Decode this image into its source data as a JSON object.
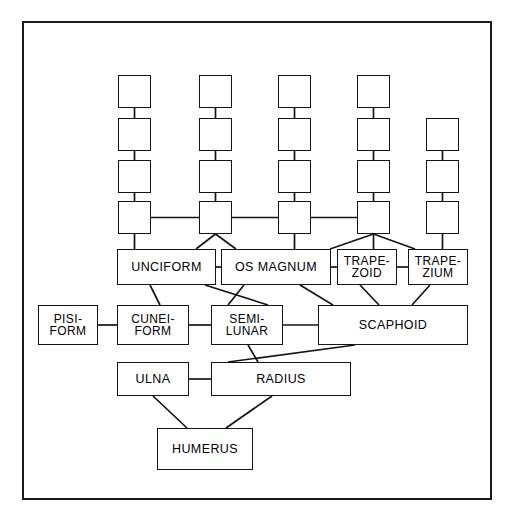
{
  "diagram": {
    "type": "node-link-diagram",
    "background_color": "#ffffff",
    "line_color": "#151515",
    "border_color": "#1a1a1a",
    "frame": {
      "x": 22,
      "y": 21,
      "width": 470,
      "height": 479
    },
    "caption": "",
    "columns": [
      {
        "name": "column-1",
        "x": 118,
        "box_count": 4,
        "top_y": 75
      },
      {
        "name": "column-2",
        "x": 199,
        "box_count": 4,
        "top_y": 75
      },
      {
        "name": "column-3",
        "x": 278,
        "box_count": 4,
        "top_y": 75
      },
      {
        "name": "column-4",
        "x": 357,
        "box_count": 4,
        "top_y": 75
      },
      {
        "name": "column-5",
        "x": 426,
        "box_count": 3,
        "top_y": 118
      }
    ],
    "blank_nodes": [
      {
        "id": "c1r1",
        "label": "",
        "x": 118,
        "y": 75,
        "w": 33,
        "h": 33
      },
      {
        "id": "c1r2",
        "label": "",
        "x": 118,
        "y": 118,
        "w": 33,
        "h": 33
      },
      {
        "id": "c1r3",
        "label": "",
        "x": 118,
        "y": 160,
        "w": 33,
        "h": 33
      },
      {
        "id": "c1r4",
        "label": "",
        "x": 118,
        "y": 201,
        "w": 33,
        "h": 33
      },
      {
        "id": "c2r1",
        "label": "",
        "x": 199,
        "y": 75,
        "w": 33,
        "h": 33
      },
      {
        "id": "c2r2",
        "label": "",
        "x": 199,
        "y": 118,
        "w": 33,
        "h": 33
      },
      {
        "id": "c2r3",
        "label": "",
        "x": 199,
        "y": 160,
        "w": 33,
        "h": 33
      },
      {
        "id": "c2r4",
        "label": "",
        "x": 199,
        "y": 201,
        "w": 33,
        "h": 33
      },
      {
        "id": "c3r1",
        "label": "",
        "x": 278,
        "y": 75,
        "w": 33,
        "h": 33
      },
      {
        "id": "c3r2",
        "label": "",
        "x": 278,
        "y": 118,
        "w": 33,
        "h": 33
      },
      {
        "id": "c3r3",
        "label": "",
        "x": 278,
        "y": 160,
        "w": 33,
        "h": 33
      },
      {
        "id": "c3r4",
        "label": "",
        "x": 278,
        "y": 201,
        "w": 33,
        "h": 33
      },
      {
        "id": "c4r1",
        "label": "",
        "x": 357,
        "y": 75,
        "w": 33,
        "h": 33
      },
      {
        "id": "c4r2",
        "label": "",
        "x": 357,
        "y": 118,
        "w": 33,
        "h": 33
      },
      {
        "id": "c4r3",
        "label": "",
        "x": 357,
        "y": 160,
        "w": 33,
        "h": 33
      },
      {
        "id": "c4r4",
        "label": "",
        "x": 357,
        "y": 201,
        "w": 33,
        "h": 33
      },
      {
        "id": "c5r1",
        "label": "",
        "x": 426,
        "y": 118,
        "w": 33,
        "h": 33
      },
      {
        "id": "c5r2",
        "label": "",
        "x": 426,
        "y": 160,
        "w": 33,
        "h": 33
      },
      {
        "id": "c5r3",
        "label": "",
        "x": 426,
        "y": 201,
        "w": 33,
        "h": 33
      }
    ],
    "labeled_nodes": [
      {
        "id": "uniciform",
        "label": "UNCIFORM",
        "x": 117,
        "y": 249,
        "w": 99,
        "h": 36
      },
      {
        "id": "os-magnum",
        "label": "OS MAGNUM",
        "x": 221,
        "y": 249,
        "w": 110,
        "h": 36
      },
      {
        "id": "trapezoid",
        "label": "TRAPE-\nZOID",
        "x": 337,
        "y": 249,
        "w": 60,
        "h": 36
      },
      {
        "id": "trapezium",
        "label": "TRAPE-\nZIUM",
        "x": 408,
        "y": 249,
        "w": 60,
        "h": 36
      },
      {
        "id": "pisiform",
        "label": "PISI-\nFORM",
        "x": 38,
        "y": 305,
        "w": 60,
        "h": 40
      },
      {
        "id": "cuneiform",
        "label": "CUNEI-\nFORM",
        "x": 117,
        "y": 305,
        "w": 72,
        "h": 40
      },
      {
        "id": "semilunar",
        "label": "SEMI-\nLUNAR",
        "x": 211,
        "y": 305,
        "w": 72,
        "h": 40
      },
      {
        "id": "scaphoid",
        "label": "SCAPHOID",
        "x": 318,
        "y": 305,
        "w": 150,
        "h": 40
      },
      {
        "id": "ulna",
        "label": "ULNA",
        "x": 117,
        "y": 362,
        "w": 72,
        "h": 34
      },
      {
        "id": "radius",
        "label": "RADIUS",
        "x": 211,
        "y": 362,
        "w": 140,
        "h": 34
      },
      {
        "id": "humerus",
        "label": "HUMERUS",
        "x": 157,
        "y": 428,
        "w": 96,
        "h": 42
      }
    ],
    "connections": [
      {
        "from": "c1r1",
        "to": "c1r2",
        "kind": "vertical"
      },
      {
        "from": "c1r2",
        "to": "c1r3",
        "kind": "vertical"
      },
      {
        "from": "c1r3",
        "to": "c1r4",
        "kind": "vertical"
      },
      {
        "from": "c2r1",
        "to": "c2r2",
        "kind": "vertical"
      },
      {
        "from": "c2r2",
        "to": "c2r3",
        "kind": "vertical"
      },
      {
        "from": "c2r3",
        "to": "c2r4",
        "kind": "vertical"
      },
      {
        "from": "c3r1",
        "to": "c3r2",
        "kind": "vertical"
      },
      {
        "from": "c3r2",
        "to": "c3r3",
        "kind": "vertical"
      },
      {
        "from": "c3r3",
        "to": "c3r4",
        "kind": "vertical"
      },
      {
        "from": "c4r1",
        "to": "c4r2",
        "kind": "vertical"
      },
      {
        "from": "c4r2",
        "to": "c4r3",
        "kind": "vertical"
      },
      {
        "from": "c4r3",
        "to": "c4r4",
        "kind": "vertical"
      },
      {
        "from": "c5r1",
        "to": "c5r2",
        "kind": "vertical"
      },
      {
        "from": "c5r2",
        "to": "c5r3",
        "kind": "vertical"
      },
      {
        "from": "c1r4",
        "to": "c2r4",
        "kind": "horizontal"
      },
      {
        "from": "c2r4",
        "to": "c3r4",
        "kind": "horizontal"
      },
      {
        "from": "c3r4",
        "to": "c4r4",
        "kind": "horizontal"
      },
      {
        "from": "c1r4",
        "to": "uniciform",
        "kind": "vertical"
      },
      {
        "from": "c2r4",
        "to": "uniciform",
        "kind": "diagonal"
      },
      {
        "from": "c2r4",
        "to": "os-magnum",
        "kind": "diagonal"
      },
      {
        "from": "c3r4",
        "to": "os-magnum",
        "kind": "vertical"
      },
      {
        "from": "c4r4",
        "to": "os-magnum",
        "kind": "diagonal"
      },
      {
        "from": "c4r4",
        "to": "trapezoid",
        "kind": "vertical"
      },
      {
        "from": "c4r4",
        "to": "trapezium",
        "kind": "diagonal"
      },
      {
        "from": "c5r3",
        "to": "trapezium",
        "kind": "vertical"
      },
      {
        "from": "uniciform",
        "to": "os-magnum",
        "kind": "horizontal"
      },
      {
        "from": "os-magnum",
        "to": "trapezoid",
        "kind": "horizontal"
      },
      {
        "from": "trapezoid",
        "to": "trapezium",
        "kind": "horizontal"
      },
      {
        "from": "uniciform",
        "to": "cuneiform",
        "kind": "diagonal"
      },
      {
        "from": "uniciform",
        "to": "semilunar",
        "kind": "diagonal"
      },
      {
        "from": "os-magnum",
        "to": "semilunar",
        "kind": "diagonal"
      },
      {
        "from": "os-magnum",
        "to": "scaphoid",
        "kind": "diagonal"
      },
      {
        "from": "trapezoid",
        "to": "scaphoid",
        "kind": "diagonal"
      },
      {
        "from": "trapezium",
        "to": "scaphoid",
        "kind": "diagonal"
      },
      {
        "from": "pisiform",
        "to": "cuneiform",
        "kind": "horizontal"
      },
      {
        "from": "cuneiform",
        "to": "semilunar",
        "kind": "horizontal"
      },
      {
        "from": "semilunar",
        "to": "scaphoid",
        "kind": "horizontal"
      },
      {
        "from": "semilunar",
        "to": "radius",
        "kind": "diagonal"
      },
      {
        "from": "scaphoid",
        "to": "radius",
        "kind": "diagonal"
      },
      {
        "from": "ulna",
        "to": "radius",
        "kind": "horizontal"
      },
      {
        "from": "ulna",
        "to": "humerus",
        "kind": "diagonal"
      },
      {
        "from": "radius",
        "to": "humerus",
        "kind": "diagonal"
      }
    ]
  }
}
